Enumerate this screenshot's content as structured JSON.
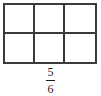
{
  "figure": {
    "type": "fraction-area-model",
    "background_color": "#ffffff",
    "line_color": "#3a3a3a",
    "text_color": "#1c1c1c"
  },
  "grid": {
    "columns": 3,
    "rows": 2,
    "total_cells": 6,
    "shaded_cells": 0,
    "cells": [
      {
        "id": "cell-1",
        "row": 1,
        "column": 1,
        "shaded": false
      },
      {
        "id": "cell-2",
        "row": 1,
        "column": 2,
        "shaded": false
      },
      {
        "id": "cell-3",
        "row": 1,
        "column": 3,
        "shaded": false
      },
      {
        "id": "cell-4",
        "row": 2,
        "column": 1,
        "shaded": false
      },
      {
        "id": "cell-5",
        "row": 2,
        "column": 2,
        "shaded": false
      },
      {
        "id": "cell-6",
        "row": 2,
        "column": 3,
        "shaded": false
      }
    ]
  },
  "fraction": {
    "numerator": "5",
    "denominator": "6",
    "display": "5/6"
  }
}
